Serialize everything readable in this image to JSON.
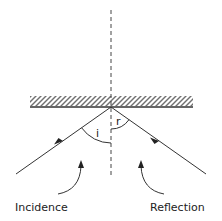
{
  "diagram": {
    "labels": {
      "incidence": "Incidence",
      "reflection": "Reflection",
      "angle_incidence": "i",
      "angle_reflection": "r"
    },
    "colors": {
      "line": "#333333",
      "hatch": "#333333",
      "background": "#ffffff"
    },
    "elements": {
      "mirror": "hatched mirror surface",
      "normal": "dashed normal line",
      "incident_ray": "incident ray with arrow",
      "reflected_ray": "reflected ray with arrow"
    }
  }
}
